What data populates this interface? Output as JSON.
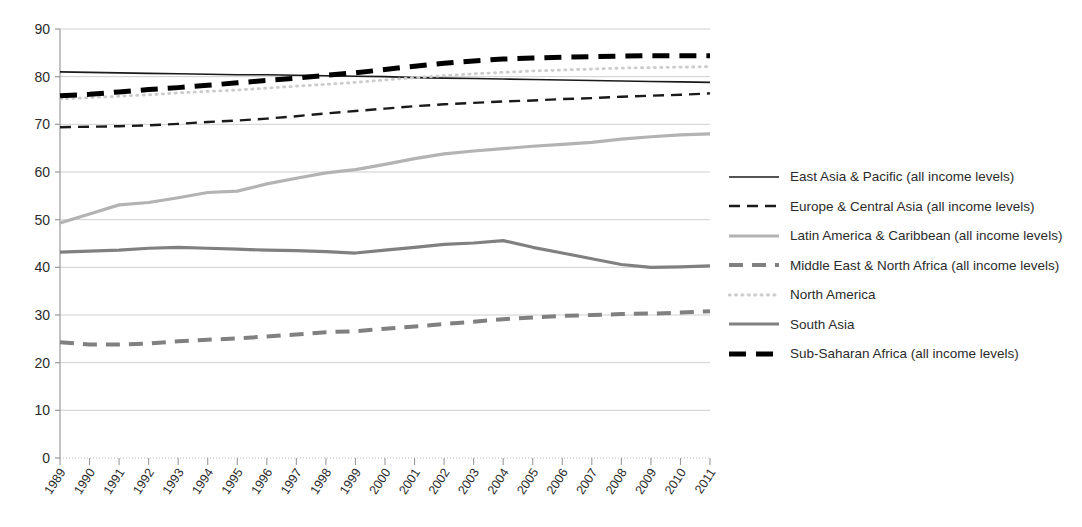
{
  "chart_data": {
    "type": "line",
    "title": "",
    "xlabel": "",
    "ylabel": "",
    "ylim": [
      0,
      90
    ],
    "ytick_step": 10,
    "grid": true,
    "legend_position": "right",
    "categories": [
      "1989",
      "1990",
      "1991",
      "1992",
      "1993",
      "1994",
      "1995",
      "1996",
      "1997",
      "1998",
      "1999",
      "2000",
      "2001",
      "2002",
      "2003",
      "2004",
      "2005",
      "2006",
      "2007",
      "2008",
      "2009",
      "2010",
      "2011"
    ],
    "yticks": [
      "0",
      "10",
      "20",
      "30",
      "40",
      "50",
      "60",
      "70",
      "80",
      "90"
    ],
    "series": [
      {
        "name": "East Asia & Pacific (all income levels)",
        "style": "solid",
        "color": "#1a1a1a",
        "width": 1.6,
        "values": [
          81.0,
          80.9,
          80.8,
          80.7,
          80.6,
          80.5,
          80.4,
          80.4,
          80.3,
          80.2,
          80.1,
          80.0,
          79.8,
          79.7,
          79.6,
          79.5,
          79.4,
          79.3,
          79.2,
          79.1,
          79.0,
          78.9,
          78.8
        ]
      },
      {
        "name": "Europe & Central Asia (all income levels)",
        "style": "dashed-long",
        "color": "#1a1a1a",
        "width": 2.4,
        "values": [
          69.4,
          69.5,
          69.6,
          69.8,
          70.1,
          70.5,
          70.8,
          71.2,
          71.7,
          72.3,
          72.8,
          73.3,
          73.8,
          74.2,
          74.5,
          74.8,
          75.0,
          75.3,
          75.5,
          75.8,
          76.0,
          76.2,
          76.5
        ]
      },
      {
        "name": "Latin America & Caribbean (all income levels)",
        "style": "solid",
        "color": "#b3b3b3",
        "width": 3.2,
        "values": [
          49.3,
          51.2,
          53.1,
          53.6,
          54.6,
          55.7,
          56.0,
          57.5,
          58.7,
          59.8,
          60.5,
          61.6,
          62.8,
          63.8,
          64.4,
          64.9,
          65.4,
          65.8,
          66.2,
          66.9,
          67.4,
          67.8,
          68.0
        ]
      },
      {
        "name": "Middle East & North Africa (all income levels)",
        "style": "dashed-thick",
        "color": "#808080",
        "width": 4.0,
        "values": [
          24.3,
          23.8,
          23.8,
          24.0,
          24.5,
          24.8,
          25.1,
          25.5,
          25.9,
          26.4,
          26.6,
          27.1,
          27.6,
          28.1,
          28.6,
          29.1,
          29.5,
          29.8,
          30.0,
          30.2,
          30.3,
          30.5,
          30.8
        ]
      },
      {
        "name": "North America",
        "style": "dotted",
        "color": "#cccccc",
        "width": 2.8,
        "values": [
          75.3,
          75.6,
          75.9,
          76.2,
          76.6,
          76.9,
          77.2,
          77.6,
          78.0,
          78.4,
          78.8,
          79.3,
          79.8,
          80.2,
          80.6,
          80.9,
          81.2,
          81.4,
          81.6,
          81.8,
          81.9,
          82.0,
          82.1
        ]
      },
      {
        "name": "South Asia",
        "style": "solid",
        "color": "#808080",
        "width": 3.2,
        "values": [
          43.2,
          43.4,
          43.6,
          44.0,
          44.2,
          44.0,
          43.8,
          43.6,
          43.5,
          43.3,
          43.0,
          43.6,
          44.2,
          44.8,
          45.1,
          45.6,
          44.2,
          43.0,
          41.8,
          40.6,
          40.0,
          40.1,
          40.3
        ]
      },
      {
        "name": "Sub-Saharan Africa (all income levels)",
        "style": "dashed-heavy",
        "color": "#000000",
        "width": 5.0,
        "values": [
          76.0,
          76.3,
          76.8,
          77.3,
          77.7,
          78.2,
          78.7,
          79.2,
          79.7,
          80.3,
          80.8,
          81.5,
          82.2,
          82.8,
          83.3,
          83.7,
          83.9,
          84.1,
          84.2,
          84.3,
          84.4,
          84.4,
          84.4
        ]
      }
    ]
  },
  "legend": {
    "items": [
      {
        "label": "East Asia & Pacific (all income levels)"
      },
      {
        "label": "Europe & Central Asia (all income levels)"
      },
      {
        "label": "Latin America & Caribbean (all income levels)"
      },
      {
        "label": "Middle East & North Africa (all income levels)"
      },
      {
        "label": "North America"
      },
      {
        "label": "South Asia"
      },
      {
        "label": "Sub-Saharan Africa (all income levels)"
      }
    ]
  }
}
